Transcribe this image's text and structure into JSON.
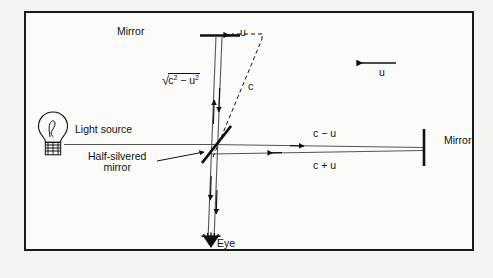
{
  "figure": {
    "border_color": "#1a1a1a",
    "background": "#fbfbfa",
    "line_color": "#101010"
  },
  "labels": {
    "mirror_top": "Mirror",
    "mirror_right": "Mirror",
    "light_source": "Light source",
    "half_silvered_line1": "Half-silvered",
    "half_silvered_line2": "mirror",
    "eye": "Eye",
    "u_top": "u",
    "u_right": "u",
    "c_diagonal": "c",
    "c_minus_u": "c − u",
    "c_plus_u": "c + u",
    "sqrt_radical": "√",
    "sqrt_body_c": "c",
    "sqrt_body_exp1": "2",
    "sqrt_body_minus": " − u",
    "sqrt_body_exp2": "2",
    "sqrt_full": "√(c² − u²)"
  },
  "icons": {
    "light_bulb": "light-bulb-icon",
    "eye": "eye-icon",
    "mirror_top": "mirror-horizontal-icon",
    "mirror_right": "mirror-vertical-icon",
    "beam_splitter": "half-silvered-mirror-icon"
  }
}
